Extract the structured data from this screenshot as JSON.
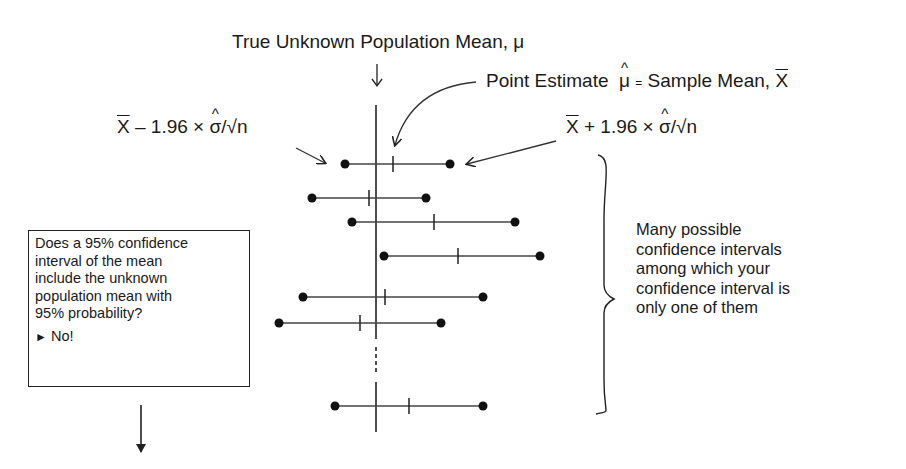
{
  "labels": {
    "true_mean": "True Unknown Population Mean, μ",
    "point_estimate_prefix": "Point Estimate",
    "mu": "μ",
    "equals": "=",
    "sample_mean_text": "Sample Mean,",
    "xbar": "X",
    "lower_bound": {
      "x": "X",
      "rest1": " – 1.96 × ",
      "sigma": "σ",
      "rest2": "/√n"
    },
    "upper_bound": {
      "x": "X",
      "rest1": " + 1.96 × ",
      "sigma": "σ",
      "rest2": "/√n"
    }
  },
  "question_box": {
    "lines": [
      "Does a 95% confidence",
      "interval of the mean",
      "include the unknown",
      "population mean with",
      "95% probability?"
    ],
    "answer_marker": "►",
    "answer": "No!"
  },
  "brace_note": {
    "lines": [
      "Many possible",
      "confidence intervals",
      "among which your",
      "confidence interval is",
      "only one of them"
    ]
  },
  "intervals": [
    {
      "left": 345,
      "mean": 393,
      "right": 450,
      "y": 164
    },
    {
      "left": 312,
      "mean": 369,
      "right": 426,
      "y": 198
    },
    {
      "left": 352,
      "mean": 434,
      "right": 515,
      "y": 222
    },
    {
      "left": 384,
      "mean": 458,
      "right": 540,
      "y": 256
    },
    {
      "left": 303,
      "mean": 385,
      "right": 483,
      "y": 297
    },
    {
      "left": 279,
      "mean": 360,
      "right": 441,
      "y": 323
    },
    {
      "left": 335,
      "mean": 409,
      "right": 483,
      "y": 406
    }
  ],
  "true_mean_x": 376
}
